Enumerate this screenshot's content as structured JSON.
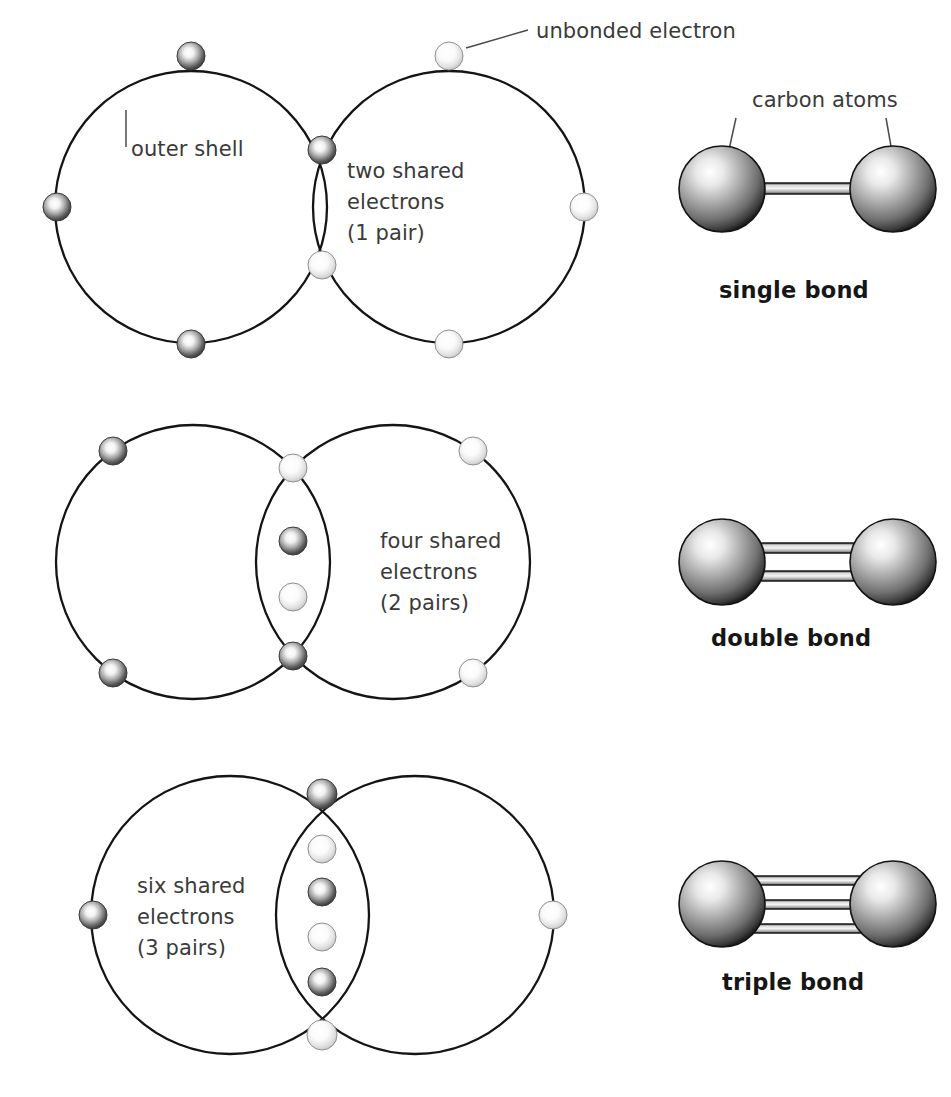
{
  "figure": {
    "background": "#ffffff",
    "line_color": "#141414",
    "text_color": "#3a3a3a",
    "bond_label_color": "#161616",
    "electron_dark_color": "#5a5a5a",
    "electron_light_color": "#e8e8e8",
    "sphere_color": "#8a8a8a"
  },
  "annotations": {
    "outer_shell": "outer shell",
    "unbonded_electron": "unbonded electron",
    "carbon_atoms": "carbon atoms"
  },
  "rows": [
    {
      "id": "single",
      "shared_label_lines": [
        "two shared",
        "electrons",
        "(1 pair)"
      ],
      "shared_electron_count": 2,
      "pair_count": 1,
      "bond_label": "single bond",
      "bond_lines": 1,
      "left_atom_electrons": 4,
      "right_atom_electrons": 4
    },
    {
      "id": "double",
      "shared_label_lines": [
        "four shared",
        "electrons",
        "(2 pairs)"
      ],
      "shared_electron_count": 4,
      "pair_count": 2,
      "bond_label": "double bond",
      "bond_lines": 2,
      "left_atom_electrons": 4,
      "right_atom_electrons": 4
    },
    {
      "id": "triple",
      "shared_label_lines": [
        "six shared",
        "electrons",
        "(3 pairs)"
      ],
      "shared_electron_count": 6,
      "pair_count": 3,
      "bond_label": "triple bond",
      "bond_lines": 3,
      "left_atom_electrons": 4,
      "right_atom_electrons": 4
    }
  ]
}
